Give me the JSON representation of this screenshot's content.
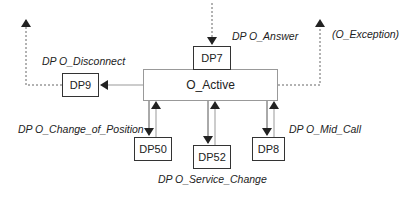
{
  "diagram": {
    "state": {
      "label": "O_Active"
    },
    "detection_points": [
      {
        "id": "dp7",
        "label": "DP7",
        "event": "DP O_Answer"
      },
      {
        "id": "dp9",
        "label": "DP9",
        "event": "DP O_Disconnect"
      },
      {
        "id": "dp50",
        "label": "DP50",
        "event": "DP O_Change_of_Position"
      },
      {
        "id": "dp52",
        "label": "DP52",
        "event": "DP O_Service_Change"
      },
      {
        "id": "dp8",
        "label": "DP8",
        "event": "DP O_Mid_Call"
      }
    ],
    "exception_label": "(O_Exception)",
    "colors": {
      "line_dark": "#333333",
      "line_light": "#999999",
      "text": "#222222"
    }
  }
}
